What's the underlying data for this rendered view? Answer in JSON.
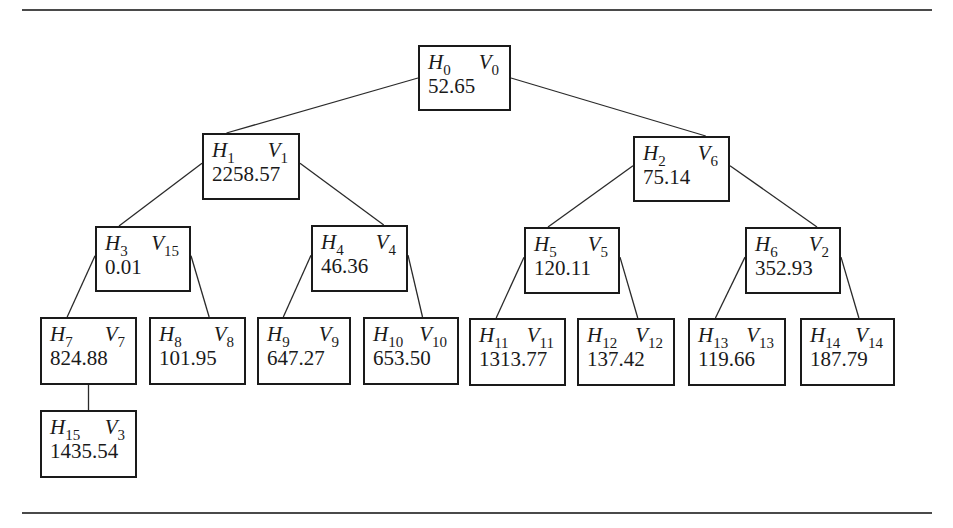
{
  "diagram": {
    "type": "binary-tree",
    "nodes": [
      {
        "id": "0",
        "h": "H",
        "h_sub": "0",
        "v": "V",
        "v_sub": "0",
        "value": "52.65",
        "box": [
          418,
          45,
          93,
          66
        ]
      },
      {
        "id": "1",
        "h": "H",
        "h_sub": "1",
        "v": "V",
        "v_sub": "1",
        "value": "2258.57",
        "box": [
          202,
          133,
          98,
          67
        ]
      },
      {
        "id": "2",
        "h": "H",
        "h_sub": "2",
        "v": "V",
        "v_sub": "6",
        "value": "75.14",
        "box": [
          633,
          136,
          97,
          66
        ]
      },
      {
        "id": "3",
        "h": "H",
        "h_sub": "3",
        "v": "V",
        "v_sub": "15",
        "value": "0.01",
        "box": [
          95,
          226,
          96,
          66
        ]
      },
      {
        "id": "4",
        "h": "H",
        "h_sub": "4",
        "v": "V",
        "v_sub": "4",
        "value": "46.36",
        "box": [
          311,
          225,
          97,
          67
        ]
      },
      {
        "id": "5",
        "h": "H",
        "h_sub": "5",
        "v": "V",
        "v_sub": "5",
        "value": "120.11",
        "box": [
          524,
          227,
          96,
          67
        ]
      },
      {
        "id": "6",
        "h": "H",
        "h_sub": "6",
        "v": "V",
        "v_sub": "2",
        "value": "352.93",
        "box": [
          745,
          227,
          96,
          67
        ]
      },
      {
        "id": "7",
        "h": "H",
        "h_sub": "7",
        "v": "V",
        "v_sub": "7",
        "value": "824.88",
        "box": [
          40,
          317,
          97,
          68
        ]
      },
      {
        "id": "8",
        "h": "H",
        "h_sub": "8",
        "v": "V",
        "v_sub": "8",
        "value": "101.95",
        "box": [
          149,
          317,
          97,
          68
        ]
      },
      {
        "id": "9",
        "h": "H",
        "h_sub": "9",
        "v": "V",
        "v_sub": "9",
        "value": "647.27",
        "box": [
          257,
          317,
          94,
          68
        ]
      },
      {
        "id": "10",
        "h": "H",
        "h_sub": "10",
        "v": "V",
        "v_sub": "10",
        "value": "653.50",
        "box": [
          363,
          317,
          96,
          68
        ]
      },
      {
        "id": "11",
        "h": "H",
        "h_sub": "11",
        "v": "V",
        "v_sub": "11",
        "value": "1313.77",
        "box": [
          469,
          318,
          97,
          68
        ]
      },
      {
        "id": "12",
        "h": "H",
        "h_sub": "12",
        "v": "V",
        "v_sub": "12",
        "value": "137.42",
        "box": [
          577,
          318,
          98,
          68
        ]
      },
      {
        "id": "13",
        "h": "H",
        "h_sub": "13",
        "v": "V",
        "v_sub": "13",
        "value": "119.66",
        "box": [
          688,
          318,
          98,
          68
        ]
      },
      {
        "id": "14",
        "h": "H",
        "h_sub": "14",
        "v": "V",
        "v_sub": "14",
        "value": "187.79",
        "box": [
          800,
          318,
          95,
          68
        ]
      },
      {
        "id": "15",
        "h": "H",
        "h_sub": "15",
        "v": "V",
        "v_sub": "3",
        "value": "1435.54",
        "box": [
          40,
          410,
          97,
          68
        ]
      }
    ],
    "edges": [
      [
        "0",
        "1"
      ],
      [
        "0",
        "2"
      ],
      [
        "1",
        "3"
      ],
      [
        "1",
        "4"
      ],
      [
        "2",
        "5"
      ],
      [
        "2",
        "6"
      ],
      [
        "3",
        "7"
      ],
      [
        "3",
        "8"
      ],
      [
        "4",
        "9"
      ],
      [
        "4",
        "10"
      ],
      [
        "5",
        "11"
      ],
      [
        "5",
        "12"
      ],
      [
        "6",
        "13"
      ],
      [
        "6",
        "14"
      ],
      [
        "7",
        "15"
      ]
    ]
  }
}
